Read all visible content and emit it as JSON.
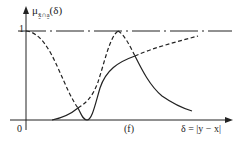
{
  "figure": {
    "y_axis_label_main": "μ",
    "y_axis_label_sub": "x̰̃∩a̰",
    "y_axis_label_arg": "(δ)",
    "y_tick_one": "1",
    "origin_label": "0",
    "x_marker_label": "(f)",
    "x_axis_label": "δ = |y − x|"
  },
  "colors": {
    "line": "#222222",
    "background": "#ffffff"
  },
  "curves": {
    "dashed_description": "membership functions parts above intersection",
    "solid_description": "intersection (minimum) envelope"
  }
}
